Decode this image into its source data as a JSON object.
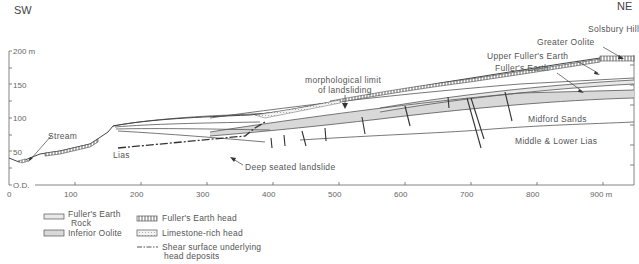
{
  "diagram": {
    "orientation": {
      "left": "SW",
      "right": "NE"
    },
    "y_axis": {
      "ticks": [
        "200 m",
        "150",
        "100",
        "50",
        "O.D."
      ]
    },
    "x_axis": {
      "ticks": [
        "0",
        "100",
        "200",
        "300",
        "400",
        "500",
        "600",
        "700",
        "800",
        "900 m"
      ]
    },
    "annotations": {
      "solsbury_hill": "Solsbury Hill",
      "greater_oolite": "Greater Oolite",
      "upper_fullers_earth": "Upper Fuller's Earth",
      "fullers_earth": "Fuller's Earth",
      "morph_limit_1": "morphological limit",
      "morph_limit_2": "of landsliding",
      "stream": "Stream",
      "lias": "Lias",
      "deep_seated": "Deep seated landslide",
      "midford_sands": "Midford Sands",
      "middle_lower_lias": "Middle & Lower Lias"
    },
    "legend": {
      "fullers_earth_rock_1": "Fuller's Earth",
      "fullers_earth_rock_2": "Rock",
      "inferior_oolite": "Inferior Oolite",
      "fullers_earth_head": "Fuller's Earth head",
      "limestone_rich_head": "Limestone-rich head",
      "shear_surface_1": "Shear surface underlying",
      "shear_surface_2": "head deposits"
    }
  }
}
